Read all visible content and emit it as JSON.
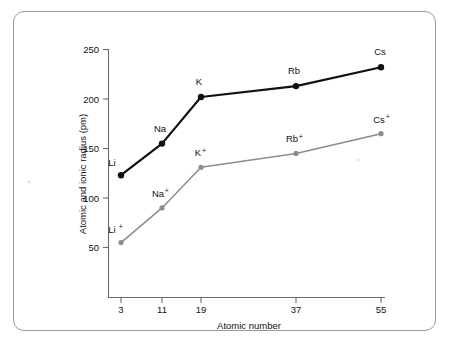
{
  "chart_data": {
    "type": "line",
    "title": "",
    "subtitle": "",
    "xlabel": "Atomic number",
    "ylabel": "Atomic and ionic radius (pm)",
    "x": [
      3,
      11,
      19,
      37,
      55
    ],
    "xtick_labels": [
      "3",
      "11",
      "19",
      "37",
      "55"
    ],
    "ytick_labels": [
      "50",
      "100",
      "150",
      "200",
      "250"
    ],
    "ytick_values": [
      50,
      100,
      150,
      200,
      250
    ],
    "ylim": [
      30,
      255
    ],
    "xlim": [
      0,
      58
    ],
    "grid": false,
    "legend": "none (points labelled inline)",
    "series": [
      {
        "name": "Atomic radius",
        "color": "#111111",
        "values": [
          123,
          155,
          202,
          213,
          232
        ],
        "point_labels": [
          "Li",
          "Na",
          "K",
          "Rb",
          "Cs"
        ],
        "point_superscripts": [
          "",
          "",
          "",
          "",
          ""
        ]
      },
      {
        "name": "Ionic radius",
        "color": "#8c8c8c",
        "values": [
          55,
          90,
          131,
          145,
          165
        ],
        "point_labels": [
          "Li",
          "Na",
          "K",
          "Rb",
          "Cs"
        ],
        "point_superscripts": [
          "+",
          "+",
          "+",
          "+",
          "+"
        ]
      }
    ],
    "annotations": [
      {
        "text": "Li",
        "series": "Atomic radius",
        "x": 3,
        "y": 123
      },
      {
        "text": "Na",
        "series": "Atomic radius",
        "x": 11,
        "y": 155
      },
      {
        "text": "K",
        "series": "Atomic radius",
        "x": 19,
        "y": 202
      },
      {
        "text": "Rb",
        "series": "Atomic radius",
        "x": 37,
        "y": 213
      },
      {
        "text": "Cs",
        "series": "Atomic radius",
        "x": 55,
        "y": 232
      },
      {
        "text": "Li+",
        "series": "Ionic radius",
        "x": 3,
        "y": 55
      },
      {
        "text": "Na+",
        "series": "Ionic radius",
        "x": 11,
        "y": 90
      },
      {
        "text": "K+",
        "series": "Ionic radius",
        "x": 19,
        "y": 131
      },
      {
        "text": "Rb+",
        "series": "Ionic radius",
        "x": 37,
        "y": 145
      },
      {
        "text": "Cs+",
        "series": "Ionic radius",
        "x": 55,
        "y": 165
      }
    ]
  },
  "axes": {
    "y_title": "Atomic and ionic radius (pm)",
    "x_title": "Atomic number",
    "y_ticks": [
      "250",
      "200",
      "150",
      "100",
      "50"
    ],
    "x_ticks": [
      "3",
      "11",
      "19",
      "37",
      "55"
    ]
  },
  "labels": {
    "li": "Li",
    "na": "Na",
    "k": "K",
    "rb": "Rb",
    "cs": "Cs",
    "li_ion_base": "Li",
    "na_ion_base": "Na",
    "k_ion_base": "K",
    "rb_ion_base": "Rb",
    "cs_ion_base": "Cs",
    "plus": "+"
  },
  "colors": {
    "atomic_series": "#111111",
    "ionic_series": "#8c8c8c",
    "axis": "#6b6b6b",
    "frame_border": "#9a9a9a",
    "background": "#ffffff"
  }
}
